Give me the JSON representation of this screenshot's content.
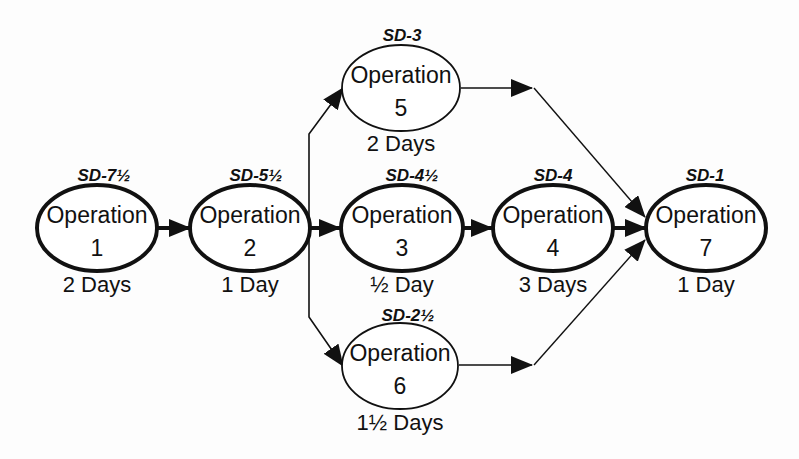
{
  "diagram": {
    "type": "operation-precedence-network",
    "nodes": [
      {
        "id": "op1",
        "label": "Operation",
        "number": "1",
        "duration": "2 Days",
        "start": "SD-7½",
        "critical": true
      },
      {
        "id": "op2",
        "label": "Operation",
        "number": "2",
        "duration": "1 Day",
        "start": "SD-5½",
        "critical": true
      },
      {
        "id": "op3",
        "label": "Operation",
        "number": "3",
        "duration": "½ Day",
        "start": "SD-4½",
        "critical": true
      },
      {
        "id": "op4",
        "label": "Operation",
        "number": "4",
        "duration": "3 Days",
        "start": "SD-4",
        "critical": true
      },
      {
        "id": "op5",
        "label": "Operation",
        "number": "5",
        "duration": "2 Days",
        "start": "SD-3",
        "critical": false
      },
      {
        "id": "op6",
        "label": "Operation",
        "number": "6",
        "duration": "1½ Days",
        "start": "SD-2½",
        "critical": false
      },
      {
        "id": "op7",
        "label": "Operation",
        "number": "7",
        "duration": "1 Day",
        "start": "SD-1",
        "critical": true
      }
    ],
    "edges": [
      {
        "from": "op1",
        "to": "op2"
      },
      {
        "from": "op2",
        "to": "op3"
      },
      {
        "from": "op2",
        "to": "op5"
      },
      {
        "from": "op2",
        "to": "op6"
      },
      {
        "from": "op3",
        "to": "op4"
      },
      {
        "from": "op4",
        "to": "op7"
      },
      {
        "from": "op5",
        "to": "op7"
      },
      {
        "from": "op6",
        "to": "op7"
      }
    ],
    "colors": {
      "stroke": "#111111",
      "background": "#fdfdfd"
    }
  }
}
